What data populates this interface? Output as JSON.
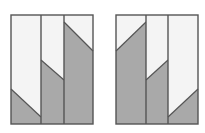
{
  "canvas": {
    "width": 205,
    "height": 133,
    "background": "#ffffff"
  },
  "colors": {
    "light": "#f4f4f4",
    "dark": "#a9a9a9",
    "stroke": "#555555"
  },
  "panels": [
    {
      "name": "left-panel",
      "x": 11,
      "y": 15,
      "width": 82,
      "height": 109,
      "columns": [
        {
          "x0": 11,
          "x1": 41,
          "cut_left_y": 89,
          "cut_right_y": 117
        },
        {
          "x0": 41,
          "x1": 64,
          "cut_left_y": 60,
          "cut_right_y": 80
        },
        {
          "x0": 64,
          "x1": 93,
          "cut_left_y": 22,
          "cut_right_y": 51
        }
      ]
    },
    {
      "name": "right-panel",
      "x": 116,
      "y": 15,
      "width": 82,
      "height": 109,
      "columns": [
        {
          "x0": 116,
          "x1": 146,
          "cut_left_y": 51,
          "cut_right_y": 22
        },
        {
          "x0": 146,
          "x1": 168,
          "cut_left_y": 80,
          "cut_right_y": 60
        },
        {
          "x0": 168,
          "x1": 198,
          "cut_left_y": 117,
          "cut_right_y": 89
        }
      ]
    }
  ]
}
